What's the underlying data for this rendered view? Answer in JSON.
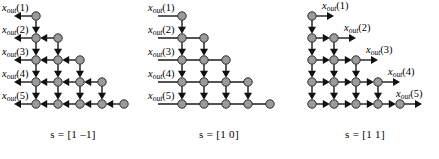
{
  "figure": {
    "type": "dependency-graph-triptych",
    "rows": 5,
    "node_count_per_row": [
      1,
      2,
      3,
      4,
      5
    ],
    "node_color": "#9b9b9b",
    "edge_color": "#1a1a1a"
  },
  "panels": [
    {
      "id": "panel-left",
      "caption": "s = [1 –1]",
      "scheduling_vector": [
        1,
        -1
      ],
      "arrow_directions": [
        "left",
        "down"
      ],
      "labels_side": "left",
      "labels": [
        {
          "var": "x",
          "sub": "out",
          "index": "(1)",
          "row": 1
        },
        {
          "var": "x",
          "sub": "out",
          "index": "(2)",
          "row": 2
        },
        {
          "var": "x",
          "sub": "out",
          "index": "(3)",
          "row": 3
        },
        {
          "var": "x",
          "sub": "out",
          "index": "(4)",
          "row": 4
        },
        {
          "var": "x",
          "sub": "out",
          "index": "(5)",
          "row": 5
        }
      ]
    },
    {
      "id": "panel-middle",
      "caption": "s = [1  0]",
      "scheduling_vector": [
        1,
        0
      ],
      "arrow_directions": [
        "down"
      ],
      "labels_side": "left",
      "labels": [
        {
          "var": "x",
          "sub": "out",
          "index": "(1)",
          "row": 1
        },
        {
          "var": "x",
          "sub": "out",
          "index": "(2)",
          "row": 2
        },
        {
          "var": "x",
          "sub": "out",
          "index": "(3)",
          "row": 3
        },
        {
          "var": "x",
          "sub": "out",
          "index": "(4)",
          "row": 4
        },
        {
          "var": "x",
          "sub": "out",
          "index": "(5)",
          "row": 5
        }
      ]
    },
    {
      "id": "panel-right",
      "caption": "s = [1  1]",
      "scheduling_vector": [
        1,
        1
      ],
      "arrow_directions": [
        "right",
        "down"
      ],
      "labels_side": "right",
      "labels": [
        {
          "var": "x",
          "sub": "out",
          "index": "(1)",
          "row": 1
        },
        {
          "var": "x",
          "sub": "out",
          "index": "(2)",
          "row": 2
        },
        {
          "var": "x",
          "sub": "out",
          "index": "(3)",
          "row": 3
        },
        {
          "var": "x",
          "sub": "out",
          "index": "(4)",
          "row": 4
        },
        {
          "var": "x",
          "sub": "out",
          "index": "(5)",
          "row": 5
        }
      ]
    }
  ]
}
